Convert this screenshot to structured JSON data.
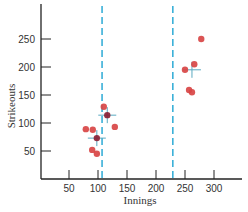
{
  "chart_data": {
    "type": "scatter",
    "title": "",
    "xlabel": "Innings",
    "ylabel": "Strikeouts",
    "xlim": [
      0,
      350
    ],
    "ylim": [
      0,
      300
    ],
    "xticks": [
      50,
      100,
      150,
      200,
      250,
      300
    ],
    "yticks": [
      50,
      100,
      150,
      200,
      250
    ],
    "xtick_labels": [
      "50",
      "100",
      "150",
      "200",
      "250",
      "300"
    ],
    "ytick_labels": [
      "50",
      "100",
      "150",
      "200",
      "250"
    ],
    "grid": false,
    "legend": null,
    "dividers": [
      {
        "x": 107,
        "style": "dashed",
        "color": "#3ab0d8"
      },
      {
        "x": 229,
        "style": "dashed",
        "color": "#3ab0d8"
      }
    ],
    "series": [
      {
        "name": "cluster-1",
        "color": "#d84545",
        "points": [
          {
            "x": 110,
            "y": 129
          },
          {
            "x": 129,
            "y": 93
          },
          {
            "x": 79,
            "y": 89
          },
          {
            "x": 91,
            "y": 88
          },
          {
            "x": 90,
            "y": 52
          },
          {
            "x": 98,
            "y": 45
          }
        ]
      },
      {
        "name": "cluster-1-highlighted",
        "color": "#8b2035",
        "points": [
          {
            "x": 116,
            "y": 114
          },
          {
            "x": 98,
            "y": 73
          }
        ]
      },
      {
        "name": "cluster-2",
        "color": "#d84545",
        "points": [
          {
            "x": 278,
            "y": 250
          },
          {
            "x": 266,
            "y": 205
          },
          {
            "x": 250,
            "y": 195
          },
          {
            "x": 257,
            "y": 159
          },
          {
            "x": 262,
            "y": 155
          }
        ]
      }
    ],
    "centroids": [
      {
        "x": 116,
        "y": 114,
        "color": "#5aa9c0"
      },
      {
        "x": 98,
        "y": 73,
        "color": "#5aa9c0"
      },
      {
        "x": 262,
        "y": 195,
        "color": "#5aa9c0"
      }
    ]
  },
  "colors": {
    "axis": "#222222",
    "point": "#d84545",
    "point_dark": "#8b2035",
    "divider": "#3ab0d8",
    "crosshair": "#5aa9c0"
  }
}
